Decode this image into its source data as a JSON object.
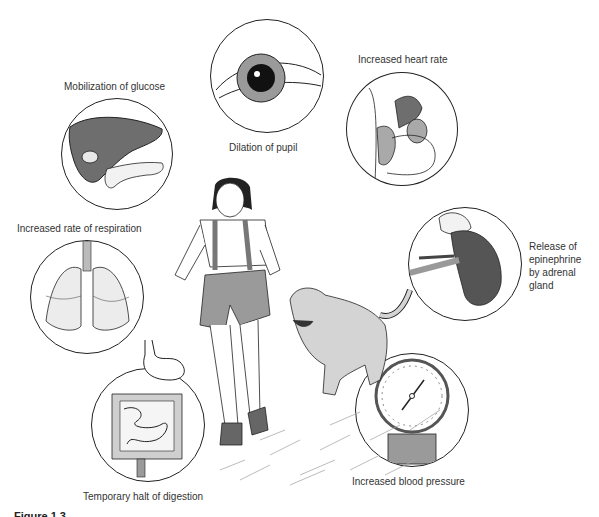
{
  "diagram": {
    "labels": {
      "glucose": "Mobilization of glucose",
      "pupil": "Dilation of pupil",
      "heart": "Increased heart rate",
      "respiration": "Increased rate of respiration",
      "epinephrine": "Release of epinephrine by adrenal gland",
      "digestion": "Temporary halt of digestion",
      "blood_pressure": "Increased blood pressure"
    },
    "figure_caption": "Figure 1.3",
    "colors": {
      "line": "#222222",
      "dark_fill": "#6e6e6e",
      "mid_fill": "#a9a9a9",
      "light_fill": "#d9d9d9"
    }
  }
}
